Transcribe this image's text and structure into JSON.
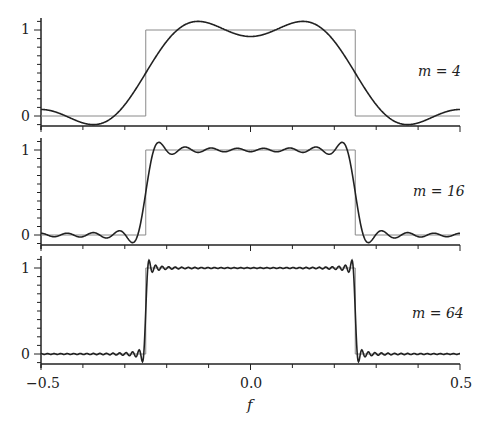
{
  "chart_data": [
    {
      "type": "line",
      "panel": 1,
      "annotation": "m = 4",
      "m": 4,
      "xlabel": "f",
      "ylabel": "",
      "xlim": [
        -0.5,
        0.5
      ],
      "ylim": [
        -0.12,
        1.12
      ],
      "yticks": [
        0,
        1
      ],
      "series": [
        {
          "name": "ideal lowpass (rect)",
          "description": "1 for |f| < 0.25, 0 otherwise",
          "color": "#888888"
        },
        {
          "name": "truncated Fourier approximation",
          "terms": 4,
          "color": "#222222",
          "x": [
            -0.5,
            -0.4,
            -0.375,
            -0.3,
            -0.25,
            -0.2,
            -0.125,
            -0.05,
            0.0,
            0.05,
            0.125,
            0.2,
            0.25,
            0.3,
            0.375,
            0.4,
            0.5
          ],
          "y": [
            0.09,
            -0.06,
            -0.09,
            0.1,
            0.5,
            0.88,
            1.09,
            0.98,
            0.91,
            0.98,
            1.09,
            0.88,
            0.5,
            0.1,
            -0.09,
            -0.06,
            0.09
          ]
        }
      ]
    },
    {
      "type": "line",
      "panel": 2,
      "annotation": "m = 16",
      "m": 16,
      "xlim": [
        -0.5,
        0.5
      ],
      "ylim": [
        -0.12,
        1.12
      ],
      "yticks": [
        0,
        1
      ],
      "series": [
        {
          "name": "ideal lowpass (rect)",
          "color": "#888888"
        },
        {
          "name": "truncated Fourier approximation",
          "terms": 16,
          "color": "#222222",
          "overshoot_peak": 1.09,
          "undershoot_min": -0.09
        }
      ]
    },
    {
      "type": "line",
      "panel": 3,
      "annotation": "m = 64",
      "m": 64,
      "xlim": [
        -0.5,
        0.5
      ],
      "ylim": [
        -0.12,
        1.12
      ],
      "yticks": [
        0,
        1
      ],
      "xticks": [
        -0.5,
        0.0,
        0.5
      ],
      "xticklabels": [
        "−0.5",
        "0.0",
        "0.5"
      ],
      "series": [
        {
          "name": "ideal lowpass (rect)",
          "color": "#888888"
        },
        {
          "name": "truncated Fourier approximation",
          "terms": 64,
          "color": "#222222",
          "overshoot_peak": 1.09,
          "undershoot_min": -0.09
        }
      ]
    }
  ],
  "labels": {
    "panel1_m": "m = 4",
    "panel2_m": "m = 16",
    "panel3_m": "m = 64",
    "ytick_one": "1",
    "ytick_zero": "0",
    "xtick_left": "−0.5",
    "xtick_mid": "0.0",
    "xtick_right": "0.5",
    "xlabel": "f"
  },
  "colors": {
    "curve": "#222222",
    "rect": "#8a8a8a",
    "axis": "#222222"
  }
}
